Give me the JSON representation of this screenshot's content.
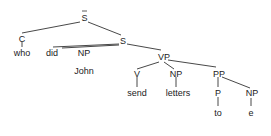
{
  "diagram": {
    "type": "syntax-tree",
    "nodes": {
      "sbar": {
        "label": "S",
        "bar": true
      },
      "c": {
        "label": "C"
      },
      "who": {
        "label": "who"
      },
      "s": {
        "label": "S"
      },
      "did": {
        "label": "did"
      },
      "np_subj": {
        "label": "NP"
      },
      "john": {
        "label": "John"
      },
      "vp": {
        "label": "VP"
      },
      "v": {
        "label": "V"
      },
      "send": {
        "label": "send"
      },
      "np_obj": {
        "label": "NP"
      },
      "letters": {
        "label": "letters"
      },
      "pp": {
        "label": "PP"
      },
      "p": {
        "label": "P"
      },
      "to": {
        "label": "to"
      },
      "np_pp": {
        "label": "NP"
      },
      "e": {
        "label": "e"
      }
    },
    "edges": [
      [
        "sbar",
        "c"
      ],
      [
        "sbar",
        "s"
      ],
      [
        "c",
        "who"
      ],
      [
        "s",
        "did"
      ],
      [
        "s",
        "np_subj"
      ],
      [
        "s",
        "vp"
      ],
      [
        "vp",
        "v"
      ],
      [
        "vp",
        "np_obj"
      ],
      [
        "vp",
        "pp"
      ],
      [
        "v",
        "send"
      ],
      [
        "np_obj",
        "letters"
      ],
      [
        "pp",
        "p"
      ],
      [
        "pp",
        "np_pp"
      ],
      [
        "p",
        "to"
      ],
      [
        "np_pp",
        "e"
      ]
    ]
  }
}
